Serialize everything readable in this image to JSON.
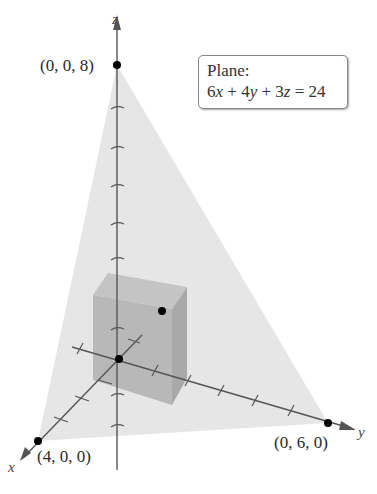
{
  "diagram": {
    "type": "3d-plane-with-inscribed-box",
    "axes": {
      "x_label": "x",
      "y_label": "y",
      "z_label": "z"
    },
    "points": {
      "z_intercept": "(0, 0, 8)",
      "x_intercept": "(4, 0, 0)",
      "y_intercept": "(0, 6, 0)"
    },
    "legend": {
      "title": "Plane:",
      "equation_parts": [
        "6",
        "x",
        " + 4",
        "y",
        " + 3",
        "z",
        " = 24"
      ]
    },
    "colors": {
      "plane_fill": "#e6e6e6",
      "box_fill": "#b4b4b4",
      "axis": "#555555",
      "point": "#000000"
    }
  }
}
